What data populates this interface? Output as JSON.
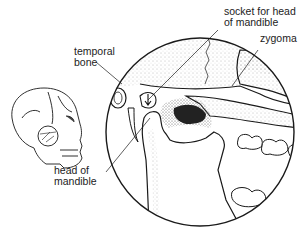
{
  "diagram": {
    "labels": {
      "socket": "socket for head\nof mandible",
      "zygoma": "zygoma",
      "temporal_bone": "temporal\nbone",
      "head_of_mandible": "head of\nmandible"
    },
    "colors": {
      "line": "#1a1a1a",
      "stipple": "#888888",
      "dark_cavity": "#222222",
      "background": "#ffffff"
    }
  }
}
